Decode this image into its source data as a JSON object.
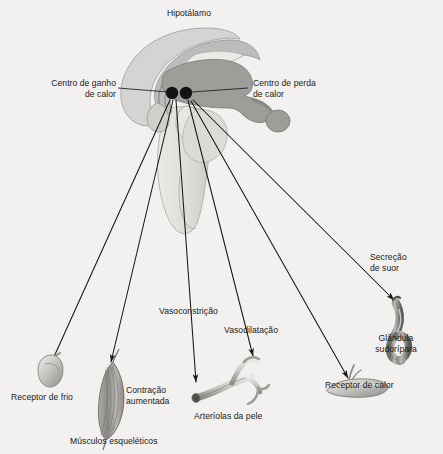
{
  "figure": {
    "title": "Hipotálamo",
    "background_color": "#f2f1ef",
    "ink_color": "#1a1a1a"
  },
  "brain": {
    "name": "Hipotálamo",
    "palette": {
      "cortex_light": "#d2d2d0",
      "cortex_mid": "#b9b9b7",
      "nucleus_dark": "#9b9b99",
      "brainstem_pale": "#e2e2df",
      "outline": "#6e6e6c"
    }
  },
  "centers": [
    {
      "id": "heat-gain",
      "label_line1": "Centro de ganho",
      "label_line2": "de calor",
      "dot_color": "#141414",
      "x": 172,
      "y": 93
    },
    {
      "id": "heat-loss",
      "label_line1": "Centro de perda",
      "label_line2": "de calor",
      "dot_color": "#141414",
      "x": 186,
      "y": 93
    }
  ],
  "pathways": [
    {
      "id": "cold-receptor",
      "label_line1": "Receptor de frio",
      "label_line2": "",
      "direction": "afferent",
      "arrow": "up",
      "organ": "cold-receptor-organ"
    },
    {
      "id": "shivering",
      "label_line1": "Contração",
      "label_line2": "aumentada",
      "direction": "efferent",
      "arrow": "down",
      "organ": "skeletal-muscle-organ",
      "organ_label": "Músculos esqueléticos"
    },
    {
      "id": "vasoconstriction",
      "label_line1": "Vasoconstrição",
      "label_line2": "",
      "direction": "efferent",
      "arrow": "down",
      "organ": "skin-arterioles-organ"
    },
    {
      "id": "vasodilation",
      "label_line1": "Vasodilatação",
      "label_line2": "",
      "direction": "efferent",
      "arrow": "down",
      "organ": "skin-arterioles-organ"
    },
    {
      "id": "heat-receptor",
      "label_line1": "Receptor de calor",
      "label_line2": "",
      "direction": "afferent",
      "arrow": "up",
      "organ": "heat-receptor-organ"
    },
    {
      "id": "sweat-secretion",
      "label_line1": "Secreção",
      "label_line2": "de suor",
      "direction": "efferent",
      "arrow": "down",
      "organ": "sweat-gland-organ"
    }
  ],
  "organs": [
    {
      "id": "cold-receptor-organ",
      "label": "Receptor de frio",
      "shape": "bulb"
    },
    {
      "id": "skeletal-muscle-organ",
      "label_line1": "Músculos esqueléticos",
      "callout_line1": "Contração",
      "callout_line2": "aumentada",
      "shape": "spindle"
    },
    {
      "id": "skin-arterioles-organ",
      "label": "Arteríolas da pele",
      "shape": "branching-vessel"
    },
    {
      "id": "heat-receptor-organ",
      "label": "Receptor de calor",
      "shape": "flattened-corpuscle"
    },
    {
      "id": "sweat-gland-organ",
      "label_line1": "Glândula",
      "label_line2": "sudorípara",
      "shape": "coiled-duct"
    }
  ],
  "labels": {
    "title": "Hipotálamo",
    "gain_l1": "Centro de ganho",
    "gain_l2": "de calor",
    "loss_l1": "Centro de perda",
    "loss_l2": "de calor",
    "cold_receptor": "Receptor de frio",
    "contraction_l1": "Contração",
    "contraction_l2": "aumentada",
    "muscles": "Músculos esqueléticos",
    "vasoconstriction": "Vasoconstrição",
    "vasodilation": "Vasodilatação",
    "arterioles": "Arteríolas da pele",
    "heat_receptor": "Receptor de calor",
    "sweat_l1": "Secreção",
    "sweat_l2": "de suor",
    "gland_l1": "Glândula",
    "gland_l2": "sudorípara"
  }
}
